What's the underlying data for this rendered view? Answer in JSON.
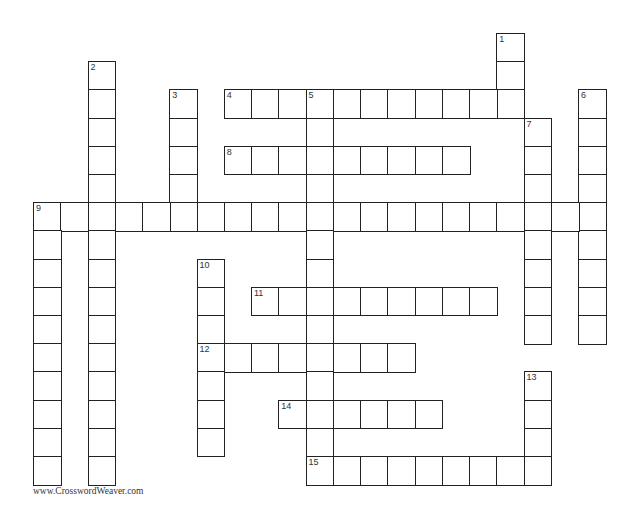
{
  "grid": {
    "origin_x": 33,
    "origin_y": 33,
    "cell_w": 27.25,
    "cell_h": 28.2,
    "words": [
      {
        "number": "1",
        "direction": "down",
        "row": 0,
        "col": 17,
        "length": 3
      },
      {
        "number": "2",
        "direction": "down",
        "row": 1,
        "col": 2,
        "length": 15
      },
      {
        "number": "3",
        "direction": "down",
        "row": 2,
        "col": 5,
        "length": 5
      },
      {
        "number": "4",
        "direction": "across",
        "row": 2,
        "col": 7,
        "length": 11
      },
      {
        "number": "5",
        "direction": "down",
        "row": 2,
        "col": 10,
        "length": 14
      },
      {
        "number": "6",
        "direction": "down",
        "row": 2,
        "col": 20,
        "length": 9
      },
      {
        "number": "7",
        "direction": "down",
        "row": 3,
        "col": 18,
        "length": 8
      },
      {
        "number": "8",
        "direction": "across",
        "row": 4,
        "col": 7,
        "length": 9
      },
      {
        "number": "9",
        "direction": "across",
        "row": 6,
        "col": 0,
        "length": 21
      },
      {
        "number": "",
        "direction": "down",
        "row": 6,
        "col": 0,
        "length": 10
      },
      {
        "number": "10",
        "direction": "down",
        "row": 8,
        "col": 6,
        "length": 7
      },
      {
        "number": "11",
        "direction": "across",
        "row": 9,
        "col": 8,
        "length": 9
      },
      {
        "number": "12",
        "direction": "across",
        "row": 11,
        "col": 6,
        "length": 8
      },
      {
        "number": "13",
        "direction": "down",
        "row": 12,
        "col": 18,
        "length": 4
      },
      {
        "number": "14",
        "direction": "across",
        "row": 13,
        "col": 9,
        "length": 6
      },
      {
        "number": "15",
        "direction": "across",
        "row": 15,
        "col": 10,
        "length": 9
      }
    ]
  },
  "footer": {
    "credit": "www.CrosswordWeaver.com"
  }
}
